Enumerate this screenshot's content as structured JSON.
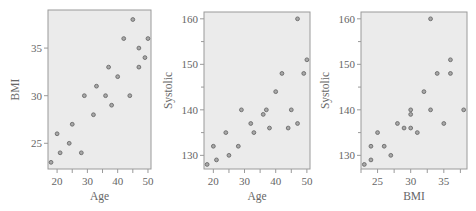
{
  "chart_data": [
    {
      "type": "scatter",
      "title": "",
      "xlabel": "Age",
      "ylabel": "BMI",
      "xlim": [
        17,
        51
      ],
      "ylim": [
        22.3,
        39
      ],
      "xticks": [
        20,
        30,
        40,
        50
      ],
      "yticks": [
        25,
        30,
        35
      ],
      "grid": false,
      "points": [
        {
          "x": 18,
          "y": 23
        },
        {
          "x": 20,
          "y": 26
        },
        {
          "x": 21,
          "y": 24
        },
        {
          "x": 24,
          "y": 25
        },
        {
          "x": 25,
          "y": 27
        },
        {
          "x": 28,
          "y": 24
        },
        {
          "x": 29,
          "y": 30
        },
        {
          "x": 32,
          "y": 28
        },
        {
          "x": 33,
          "y": 31
        },
        {
          "x": 36,
          "y": 30
        },
        {
          "x": 37,
          "y": 33
        },
        {
          "x": 38,
          "y": 29
        },
        {
          "x": 40,
          "y": 32
        },
        {
          "x": 42,
          "y": 36
        },
        {
          "x": 44,
          "y": 30
        },
        {
          "x": 45,
          "y": 38
        },
        {
          "x": 47,
          "y": 35
        },
        {
          "x": 47,
          "y": 33
        },
        {
          "x": 49,
          "y": 34
        },
        {
          "x": 50,
          "y": 36
        }
      ]
    },
    {
      "type": "scatter",
      "title": "",
      "xlabel": "Age",
      "ylabel": "Systolic",
      "xlim": [
        17,
        51
      ],
      "ylim": [
        127,
        161.5
      ],
      "xticks": [
        20,
        30,
        40,
        50
      ],
      "yticks": [
        130,
        140,
        150,
        160
      ],
      "yminor": [
        135,
        145,
        155
      ],
      "grid": false,
      "points": [
        {
          "x": 18,
          "y": 128
        },
        {
          "x": 20,
          "y": 132
        },
        {
          "x": 21,
          "y": 129
        },
        {
          "x": 24,
          "y": 135
        },
        {
          "x": 25,
          "y": 130
        },
        {
          "x": 28,
          "y": 132
        },
        {
          "x": 29,
          "y": 140
        },
        {
          "x": 32,
          "y": 137
        },
        {
          "x": 33,
          "y": 135
        },
        {
          "x": 36,
          "y": 139
        },
        {
          "x": 37,
          "y": 140
        },
        {
          "x": 38,
          "y": 136
        },
        {
          "x": 40,
          "y": 144
        },
        {
          "x": 42,
          "y": 148
        },
        {
          "x": 44,
          "y": 136
        },
        {
          "x": 45,
          "y": 140
        },
        {
          "x": 47,
          "y": 137
        },
        {
          "x": 47,
          "y": 160
        },
        {
          "x": 49,
          "y": 148
        },
        {
          "x": 50,
          "y": 151
        }
      ]
    },
    {
      "type": "scatter",
      "title": "",
      "xlabel": "BMI",
      "ylabel": "Systolic",
      "xlim": [
        22.5,
        38.5
      ],
      "ylim": [
        127,
        161.5
      ],
      "xticks": [
        25,
        30,
        35
      ],
      "yticks": [
        130,
        140,
        150,
        160
      ],
      "yminor": [
        135,
        145,
        155
      ],
      "grid": false,
      "points": [
        {
          "x": 23,
          "y": 128
        },
        {
          "x": 26,
          "y": 132
        },
        {
          "x": 24,
          "y": 129
        },
        {
          "x": 25,
          "y": 135
        },
        {
          "x": 27,
          "y": 130
        },
        {
          "x": 24,
          "y": 132
        },
        {
          "x": 30,
          "y": 140
        },
        {
          "x": 28,
          "y": 137
        },
        {
          "x": 31,
          "y": 135
        },
        {
          "x": 30,
          "y": 139
        },
        {
          "x": 33,
          "y": 140
        },
        {
          "x": 29,
          "y": 136
        },
        {
          "x": 32,
          "y": 144
        },
        {
          "x": 36,
          "y": 148
        },
        {
          "x": 30,
          "y": 136
        },
        {
          "x": 38,
          "y": 140
        },
        {
          "x": 35,
          "y": 137
        },
        {
          "x": 33,
          "y": 160
        },
        {
          "x": 34,
          "y": 148
        },
        {
          "x": 36,
          "y": 151
        }
      ]
    }
  ],
  "style": {
    "panel_bg": "#ebebeb",
    "frame": "#9a9a9a",
    "point_fill": "#a8a8a8",
    "point_stroke": "#6a6a6a",
    "text": "#666666"
  },
  "layout": [
    {
      "left": 0,
      "plot": {
        "x0": 48,
        "x1": 151,
        "y0": 10,
        "y1": 169
      }
    },
    {
      "left": 158,
      "plot": {
        "x0": 46,
        "x1": 152,
        "y0": 12,
        "y1": 169
      }
    },
    {
      "left": 315,
      "plot": {
        "x0": 46,
        "x1": 152,
        "y0": 12,
        "y1": 169
      }
    }
  ]
}
